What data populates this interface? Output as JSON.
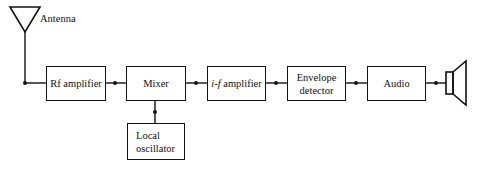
{
  "diagram": {
    "type": "block-diagram",
    "antenna": {
      "label": "Antenna"
    },
    "blocks": [
      {
        "id": "rf",
        "label": "Rf amplifier"
      },
      {
        "id": "mixer",
        "label": "Mixer"
      },
      {
        "id": "if",
        "label_italic": "i-f",
        "label_rest": " amplifier"
      },
      {
        "id": "env",
        "line1": "Envelope",
        "line2": "detector"
      },
      {
        "id": "audio",
        "label": "Audio"
      },
      {
        "id": "lo",
        "line1": "Local",
        "line2": "oscillator"
      }
    ],
    "output": {
      "icon": "speaker-icon"
    },
    "connections": [
      [
        "antenna",
        "rf"
      ],
      [
        "rf",
        "mixer"
      ],
      [
        "mixer",
        "if"
      ],
      [
        "if",
        "env"
      ],
      [
        "env",
        "audio"
      ],
      [
        "audio",
        "speaker"
      ],
      [
        "lo",
        "mixer"
      ]
    ]
  }
}
